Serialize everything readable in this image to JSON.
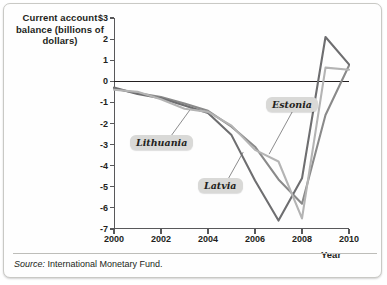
{
  "chart_data": {
    "type": "line",
    "title": "",
    "ylabel": "Current account balance (billions of dollars)",
    "xlabel": "Year",
    "x": [
      2000,
      2001,
      2002,
      2003,
      2004,
      2005,
      2006,
      2007,
      2008,
      2009,
      2010
    ],
    "xlim": [
      2000,
      2010
    ],
    "ylim": [
      -7,
      3
    ],
    "yticks": [
      3,
      2,
      1,
      0,
      -1,
      -2,
      -3,
      -4,
      -5,
      -6,
      -7
    ],
    "ytick_labels": [
      "$3",
      "2",
      "1",
      "0",
      "-1",
      "-2",
      "-3",
      "-4",
      "-5",
      "-6",
      "-7"
    ],
    "xticks": [
      2000,
      2002,
      2004,
      2006,
      2008,
      2010
    ],
    "xtick_labels": [
      "2000",
      "2002",
      "2004",
      "2006",
      "2008",
      "2010"
    ],
    "grid": false,
    "zero_line": true,
    "legend_position": "inline-callout",
    "series": [
      {
        "name": "Lithuania",
        "color": "#8a8a8a",
        "values": [
          -0.35,
          -0.55,
          -0.75,
          -1.05,
          -1.4,
          -2.15,
          -3.1,
          -4.65,
          -5.8,
          -1.6,
          0.75
        ]
      },
      {
        "name": "Latvia",
        "color": "#6e6e70",
        "values": [
          -0.3,
          -0.6,
          -0.8,
          -1.15,
          -1.5,
          -2.55,
          -4.7,
          -6.6,
          -4.6,
          2.1,
          0.8
        ]
      },
      {
        "name": "Estonia",
        "color": "#b4b4b4",
        "values": [
          -0.4,
          -0.5,
          -0.85,
          -1.3,
          -1.45,
          -2.1,
          -3.25,
          -3.8,
          -6.5,
          0.65,
          0.55
        ]
      }
    ],
    "annotations": [
      {
        "label": "Lithuania",
        "points_to_year": 2003.3,
        "points_to_value": -1.25
      },
      {
        "label": "Latvia",
        "points_to_year": 2005.5,
        "points_to_value": -3.35
      },
      {
        "label": "Estonia",
        "points_to_year": 2006.6,
        "points_to_value": -3.45
      }
    ]
  },
  "source": {
    "prefix": "Source:",
    "text": "International Monetary Fund."
  }
}
